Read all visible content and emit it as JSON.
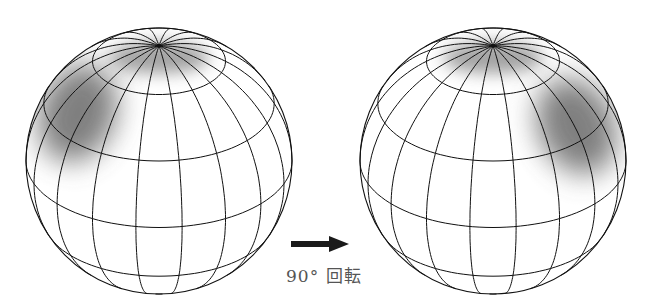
{
  "figure": {
    "caption_label": "90° 回転",
    "arrow": {
      "direction": "right",
      "color": "#1a1a1a"
    },
    "spheres": [
      {
        "name": "before",
        "cx": 159,
        "cy": 161,
        "r": 133,
        "shade_lon": -60,
        "shade_lat": 45
      },
      {
        "name": "after",
        "cx": 493,
        "cy": 161,
        "r": 133,
        "shade_lon": 55,
        "shade_lat": 40
      }
    ],
    "graticule": {
      "meridians": 18,
      "parallels_deg": [
        -60,
        -30,
        0,
        30,
        60
      ],
      "tilt_deg": 60,
      "line_color": "#111"
    }
  }
}
